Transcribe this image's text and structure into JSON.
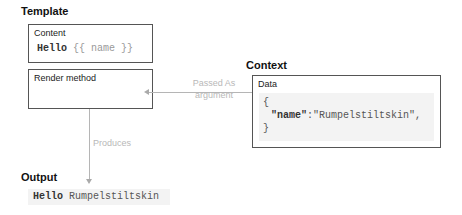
{
  "template": {
    "title": "Template",
    "content_box": {
      "label": "Content",
      "code_keyword": "Hello",
      "code_open": "{{",
      "code_var": "name",
      "code_close": "}}"
    },
    "render_box": {
      "label": "Render method"
    }
  },
  "context": {
    "title": "Context",
    "data_box": {
      "label": "Data",
      "line_open": "{",
      "key": "\"name\"",
      "colon": ":",
      "value": "\"Rumpelstiltskin\",",
      "line_close": "}"
    }
  },
  "arrows": {
    "passed_as_line1": "Passed As",
    "passed_as_line2": "argument",
    "produces": "Produces"
  },
  "output": {
    "title": "Output",
    "code_keyword": "Hello",
    "code_value": "Rumpelstiltskin"
  }
}
